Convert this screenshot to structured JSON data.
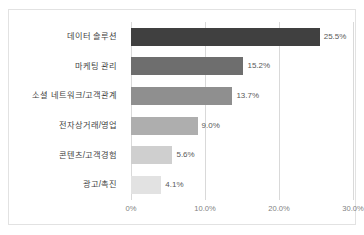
{
  "chart_data": {
    "type": "bar",
    "orientation": "horizontal",
    "title": "",
    "xlabel": "",
    "ylabel": "",
    "categories": [
      "데이터 솔루션",
      "마케팅 관리",
      "소셜 네트워크/고객관계",
      "전자상거래/영업",
      "콘텐츠/고객경험",
      "광고/촉진"
    ],
    "values": [
      25.5,
      15.2,
      13.7,
      9.0,
      5.6,
      4.1
    ],
    "data_labels": [
      "25.5%",
      "15.2%",
      "13.7%",
      "9.0%",
      "5.6%",
      "4.1%"
    ],
    "bar_colors": [
      "#404040",
      "#6e6e6e",
      "#8f8f8f",
      "#aeaeae",
      "#cfcfcf",
      "#e2e2e2"
    ],
    "xlim": [
      0,
      30
    ],
    "xticks": [
      0,
      10,
      20,
      30
    ],
    "xtick_labels": [
      "0%",
      "10.0%",
      "20.0%",
      "30.0%"
    ],
    "grid": true,
    "legend": null
  },
  "style": {
    "frame_border_color": "#e2e2e2",
    "gridline_color": "#d9d9d9",
    "label_color": "#3f3f3f",
    "value_color": "#595959",
    "tick_color": "#7f7f7f",
    "background": "#ffffff"
  }
}
